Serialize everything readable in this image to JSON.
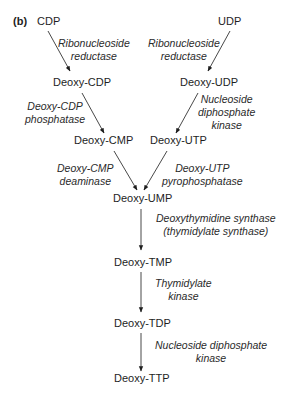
{
  "panel_label": "(b)",
  "nodes": {
    "cdp": "CDP",
    "udp": "UDP",
    "deoxy_cdp": "Deoxy-CDP",
    "deoxy_udp": "Deoxy-UDP",
    "deoxy_cmp": "Deoxy-CMP",
    "deoxy_utp": "Deoxy-UTP",
    "deoxy_ump": "Deoxy-UMP",
    "deoxy_tmp": "Deoxy-TMP",
    "deoxy_tdp": "Deoxy-TDP",
    "deoxy_ttp": "Deoxy-TTP"
  },
  "enzymes": {
    "rnr_left": [
      "Ribonucleoside",
      "reductase"
    ],
    "rnr_right": [
      "Ribonucleoside",
      "reductase"
    ],
    "dcdp_phosphatase": [
      "Deoxy-CDP",
      "phosphatase"
    ],
    "ndk_upper": [
      "Nucleoside",
      "diphosphate",
      "kinase"
    ],
    "dcmp_deaminase": [
      "Deoxy-CMP",
      "deaminase"
    ],
    "dutp_pyrophosphatase": [
      "Deoxy-UTP",
      "pyrophosphatase"
    ],
    "thymidylate_synthase": [
      "Deoxythymidine synthase",
      "(thymidylate synthase)"
    ],
    "thymidylate_kinase": [
      "Thymidylate",
      "kinase"
    ],
    "ndk_lower": [
      "Nucleoside diphosphate",
      "kinase"
    ]
  }
}
